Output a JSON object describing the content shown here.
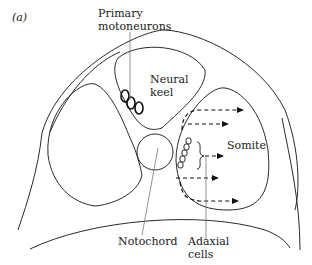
{
  "panel_label": "(a)",
  "labels": {
    "primary_motoneurons_line1": "Primary",
    "primary_motoneurons_line2": "motoneurons",
    "neural_keel_line1": "Neural",
    "neural_keel_line2": "keel",
    "somite": "Somite",
    "notochord": "Notochord",
    "adaxial_line1": "Adaxial",
    "adaxial_line2": "cells"
  },
  "colors": {
    "line": "#2a2a2a",
    "leader": "#777777",
    "background": "#ffffff"
  }
}
